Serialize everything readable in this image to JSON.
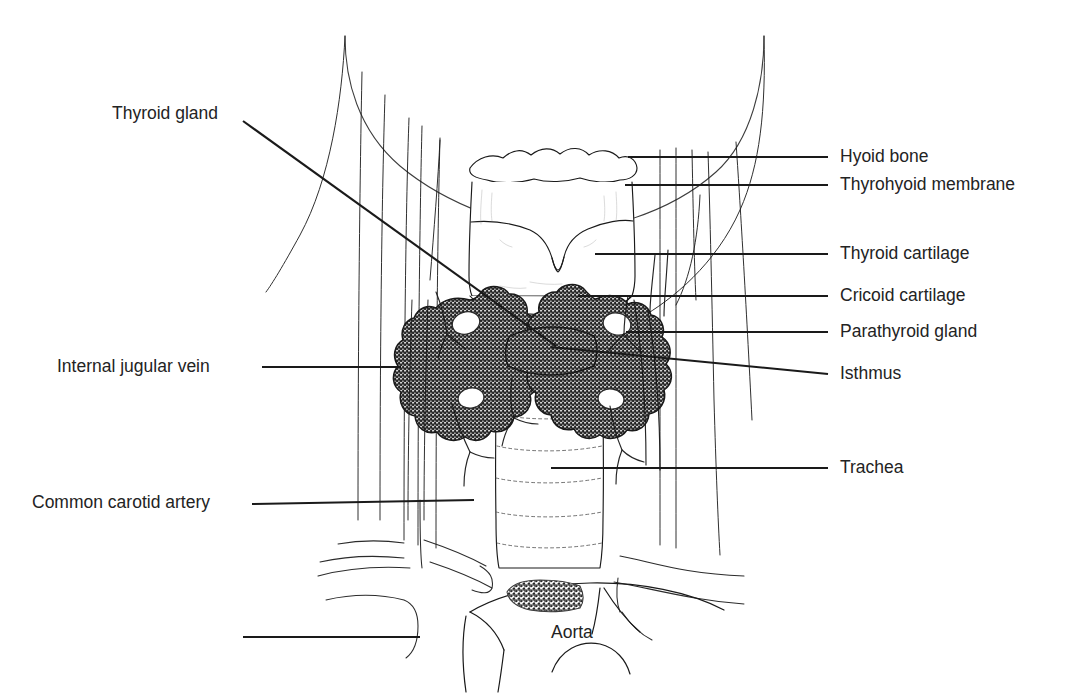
{
  "figure": {
    "style": "black-and-white line drawing",
    "width": 1079,
    "height": 697,
    "background_color": "#ffffff",
    "line_color": "#1a1a1a",
    "text_color": "#232323",
    "stipple_color": "#4a4a4a"
  },
  "labels": {
    "thyroid_gland": "Thyroid gland",
    "internal_jugular_vein": "Internal jugular vein",
    "common_carotid_artery": "Common carotid artery",
    "hyoid_bone": "Hyoid bone",
    "thyrohyoid_membrane": "Thyrohyoid membrane",
    "thyroid_cartilage": "Thyroid cartilage",
    "cricoid_cartilage": "Cricoid cartilage",
    "parathyroid_gland": "Parathyroid gland",
    "isthmus": "Isthmus",
    "trachea": "Trachea",
    "aorta": "Aorta"
  },
  "leader_lines": [
    {
      "name": "thyroid-gland-leader",
      "from": [
        243,
        121
      ],
      "to": [
        556,
        346
      ]
    },
    {
      "name": "internal-jugular-vein-leader",
      "from": [
        262,
        367
      ],
      "to": [
        401,
        367
      ]
    },
    {
      "name": "common-carotid-artery-leader",
      "from": [
        252,
        504
      ],
      "to": [
        474,
        500
      ]
    },
    {
      "name": "unlabeled-lower-left-leader",
      "from": [
        243,
        637
      ],
      "to": [
        420,
        637
      ]
    },
    {
      "name": "hyoid-bone-leader",
      "from": [
        628,
        157
      ],
      "to": [
        828,
        157
      ]
    },
    {
      "name": "thyrohyoid-membrane-leader",
      "from": [
        625,
        185
      ],
      "to": [
        828,
        185
      ]
    },
    {
      "name": "thyroid-cartilage-leader",
      "from": [
        595,
        254
      ],
      "to": [
        828,
        254
      ]
    },
    {
      "name": "cricoid-cartilage-leader",
      "from": [
        578,
        296
      ],
      "to": [
        828,
        296
      ]
    },
    {
      "name": "parathyroid-gland-leader",
      "from": [
        626,
        332
      ],
      "to": [
        828,
        332
      ]
    },
    {
      "name": "isthmus-leader",
      "from": [
        551,
        347
      ],
      "to": [
        828,
        374
      ]
    },
    {
      "name": "trachea-leader",
      "from": [
        551,
        468
      ],
      "to": [
        828,
        468
      ]
    }
  ]
}
